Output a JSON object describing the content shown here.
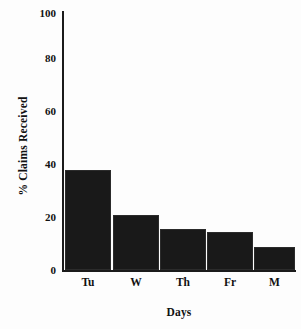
{
  "chart_data": {
    "type": "bar",
    "title": "",
    "xlabel": "Days",
    "ylabel": "% Claims Received",
    "categories": [
      "Tu",
      "W",
      "Th",
      "Fr",
      "M"
    ],
    "values": [
      40,
      22,
      16.5,
      15,
      9
    ],
    "ylim": [
      0,
      100
    ],
    "yticks": [
      0,
      20,
      40,
      60,
      80,
      100
    ],
    "ytick_labels": [
      "0",
      "20",
      "40",
      "60",
      "80",
      "100"
    ],
    "xtick_labels": [
      "Tu",
      "W",
      "Th",
      "Fr",
      "M"
    ],
    "grid": false,
    "legend": null,
    "bar_color": "#191919",
    "axis_color": "#1b1b1b",
    "background_color": "#fdfdfd",
    "series": [
      {
        "name": "% Claims Received",
        "values": [
          40,
          22,
          16.5,
          15,
          9
        ]
      }
    ]
  }
}
